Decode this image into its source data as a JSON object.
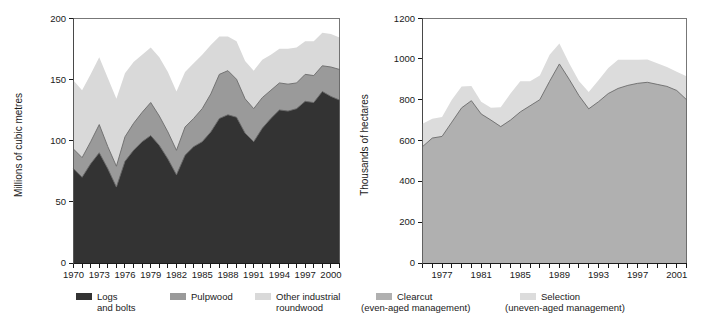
{
  "figure": {
    "background": "#ffffff",
    "panels": [
      "left",
      "right"
    ]
  },
  "left_panel": {
    "ylabel": "Millions of cubic metres",
    "yticks": [
      "0",
      "50",
      "100",
      "150",
      "200"
    ],
    "xticks": [
      "1970",
      "1973",
      "1976",
      "1979",
      "1982",
      "1985",
      "1988",
      "1991",
      "1994",
      "1997",
      "2000"
    ],
    "legend": [
      {
        "label_line1": "Logs",
        "label_line2": "and bolts",
        "color": "#333333"
      },
      {
        "label_line1": "Pulpwood",
        "label_line2": "",
        "color": "#9a9a9a"
      },
      {
        "label_line1": "Other industrial",
        "label_line2": "roundwood",
        "color": "#d9d9d9"
      }
    ]
  },
  "right_panel": {
    "ylabel": "Thousands of hectares",
    "yticks": [
      "0",
      "200",
      "400",
      "600",
      "800",
      "1000",
      "1200"
    ],
    "xticks": [
      "1977",
      "1981",
      "1985",
      "1989",
      "1993",
      "1997",
      "2001"
    ],
    "legend": [
      {
        "label_line1": "Clearcut",
        "label_line2": "(even-aged management)",
        "color": "#b0b0b0"
      },
      {
        "label_line1": "Selection",
        "label_line2": "(uneven-aged management)",
        "color": "#dcdcdc"
      }
    ]
  },
  "chart_data": [
    {
      "type": "area",
      "id": "industrial-roundwood-production",
      "stacked": true,
      "title": "",
      "xlabel": "",
      "ylabel": "Millions of cubic metres",
      "ylim": [
        0,
        200
      ],
      "yticks": [
        0,
        50,
        100,
        150,
        200
      ],
      "grid": false,
      "legend_position": "below",
      "x": [
        1970,
        1971,
        1972,
        1973,
        1974,
        1975,
        1976,
        1977,
        1978,
        1979,
        1980,
        1981,
        1982,
        1983,
        1984,
        1985,
        1986,
        1987,
        1988,
        1989,
        1990,
        1991,
        1992,
        1993,
        1994,
        1995,
        1996,
        1997,
        1998,
        1999,
        2000,
        2001
      ],
      "xtick_labels": [
        "1970",
        "1973",
        "1976",
        "1979",
        "1982",
        "1985",
        "1988",
        "1991",
        "1994",
        "1997",
        "2000"
      ],
      "series": [
        {
          "name": "Logs and bolts",
          "color": "#333333",
          "values": [
            77,
            70,
            81,
            90,
            77,
            62,
            83,
            92,
            99,
            104,
            96,
            85,
            72,
            88,
            95,
            99,
            107,
            118,
            121,
            119,
            106,
            99,
            110,
            118,
            125,
            124,
            126,
            132,
            131,
            140,
            136,
            133
          ]
        },
        {
          "name": "Pulpwood",
          "color": "#9a9a9a",
          "values": [
            16,
            16,
            18,
            23,
            18,
            17,
            20,
            22,
            24,
            27,
            24,
            22,
            20,
            23,
            23,
            27,
            31,
            36,
            36,
            31,
            28,
            27,
            25,
            23,
            22,
            22,
            21,
            22,
            22,
            21,
            24,
            25
          ]
        },
        {
          "name": "Other industrial roundwood",
          "color": "#d9d9d9",
          "values": [
            56,
            55,
            55,
            55,
            56,
            55,
            52,
            50,
            47,
            45,
            48,
            49,
            48,
            45,
            45,
            44,
            40,
            31,
            28,
            31,
            31,
            31,
            31,
            29,
            28,
            29,
            29,
            27,
            28,
            27,
            27,
            26
          ]
        }
      ]
    },
    {
      "type": "area",
      "id": "harvest-area-by-silvicultural-system",
      "stacked": true,
      "title": "",
      "xlabel": "",
      "ylabel": "Thousands of hectares",
      "ylim": [
        0,
        1200
      ],
      "yticks": [
        0,
        200,
        400,
        600,
        800,
        1000,
        1200
      ],
      "grid": false,
      "legend_position": "below",
      "x": [
        1975,
        1976,
        1977,
        1978,
        1979,
        1980,
        1981,
        1982,
        1983,
        1984,
        1985,
        1986,
        1987,
        1988,
        1989,
        1990,
        1991,
        1992,
        1993,
        1994,
        1995,
        1996,
        1997,
        1998,
        1999,
        2000,
        2001,
        2002
      ],
      "xtick_labels": [
        "1977",
        "1981",
        "1985",
        "1989",
        "1993",
        "1997",
        "2001"
      ],
      "series": [
        {
          "name": "Clearcut (even-aged management)",
          "color": "#b0b0b0",
          "values": [
            570,
            612,
            620,
            690,
            760,
            795,
            730,
            700,
            668,
            700,
            740,
            770,
            800,
            890,
            975,
            900,
            820,
            755,
            790,
            830,
            855,
            870,
            880,
            885,
            875,
            865,
            845,
            800
          ]
        },
        {
          "name": "Selection (uneven-aged management)",
          "color": "#dcdcdc",
          "values": [
            112,
            95,
            95,
            110,
            105,
            72,
            60,
            60,
            95,
            130,
            150,
            120,
            118,
            130,
            100,
            78,
            72,
            82,
            105,
            125,
            140,
            125,
            115,
            112,
            103,
            95,
            92,
            115
          ]
        }
      ]
    }
  ]
}
